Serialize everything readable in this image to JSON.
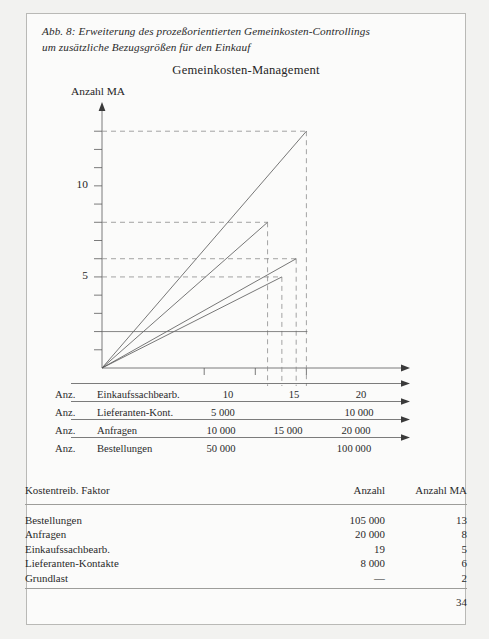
{
  "figure": {
    "caption_line1": "Abb. 8: Erweiterung des prozeßorientierten Gemeinkosten-Controllings",
    "caption_line2": "um zusätzliche Bezugsgrößen für den Einkauf",
    "chart_title": "Gemeinkosten-Management"
  },
  "chart_data": {
    "type": "line",
    "title": "Gemeinkosten-Management",
    "ylabel": "Anzahl MA",
    "xlabel": "",
    "ylim": [
      0,
      14
    ],
    "yticks": [
      0,
      1,
      2,
      3,
      4,
      5,
      6,
      7,
      8,
      9,
      10,
      11,
      12,
      13
    ],
    "ytick_labels": {
      "5": "5",
      "10": "10"
    },
    "grid": false,
    "legend_position": "none",
    "baseline": {
      "label": "Grundlast",
      "value": 2
    },
    "series": [
      {
        "name": "Bestellungen",
        "x_end": 20.0,
        "y_end": 13,
        "guide": "dashed"
      },
      {
        "name": "Anfragen",
        "x_end": 16.2,
        "y_end": 8,
        "guide": "dashed"
      },
      {
        "name": "Lieferanten-Kontakte",
        "x_end": 19.0,
        "y_end": 6,
        "guide": "dashed"
      },
      {
        "name": "Einkaufssachbearb.",
        "x_end": 17.6,
        "y_end": 5,
        "guide": "dashed"
      }
    ],
    "x_axes": [
      {
        "prefix": "Anz.",
        "name": "Einkaufssachbearb.",
        "ticks": [
          "10",
          "15",
          "20"
        ]
      },
      {
        "prefix": "Anz.",
        "name": "Lieferanten-Kont.",
        "ticks": [
          "5 000",
          "",
          "10 000"
        ]
      },
      {
        "prefix": "Anz.",
        "name": "Anfragen",
        "ticks": [
          "10 000",
          "15 000",
          "20 000"
        ]
      },
      {
        "prefix": "Anz.",
        "name": "Bestellungen",
        "ticks": [
          "50 000",
          "",
          "100 000"
        ]
      }
    ]
  },
  "table": {
    "headers": {
      "factor": "Kostentreib. Faktor",
      "anzahl": "Anzahl",
      "ma": "Anzahl MA"
    },
    "rows": [
      {
        "factor": "Bestellungen",
        "anzahl": "105 000",
        "ma": "13"
      },
      {
        "factor": "Anfragen",
        "anzahl": "20 000",
        "ma": "8"
      },
      {
        "factor": "Einkaufssachbearb.",
        "anzahl": "19",
        "ma": "5"
      },
      {
        "factor": "Lieferanten-Kontakte",
        "anzahl": "8 000",
        "ma": "6"
      },
      {
        "factor": "Grundlast",
        "anzahl": "—",
        "ma": "2"
      }
    ],
    "total_ma": "34"
  }
}
